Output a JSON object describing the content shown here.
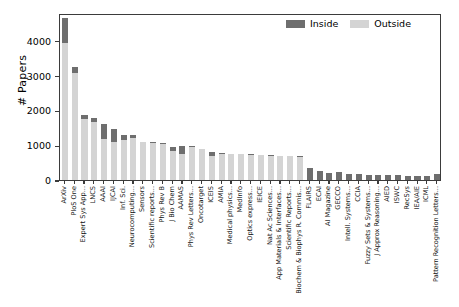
{
  "chart_data": {
    "type": "bar",
    "stacked": true,
    "title": "",
    "xlabel": "",
    "ylabel": "# Papers",
    "ylim": [
      0,
      4800
    ],
    "yticks": [
      0,
      1000,
      2000,
      3000,
      4000
    ],
    "ytick_labels": [
      "0",
      "1000",
      "2000",
      "3000",
      "4000"
    ],
    "grid": false,
    "legend_position": "upper right",
    "colors": {
      "inside": "#6e6e6e",
      "outside": "#d4d4d4",
      "axis": "#3b3b3b"
    },
    "series": [
      {
        "name": "Inside",
        "values": [
          720,
          180,
          130,
          110,
          450,
          400,
          160,
          100,
          20,
          15,
          15,
          140,
          240,
          20,
          15,
          130,
          10,
          10,
          10,
          10,
          10,
          10,
          10,
          10,
          10,
          340,
          270,
          215,
          220,
          180,
          170,
          150,
          140,
          135,
          130,
          125,
          120,
          120,
          170
        ]
      },
      {
        "name": "Outside",
        "values": [
          3930,
          3075,
          1740,
          1680,
          1165,
          1080,
          1140,
          1200,
          1080,
          1070,
          1040,
          820,
          750,
          950,
          890,
          680,
          760,
          745,
          735,
          725,
          710,
          700,
          690,
          680,
          670,
          0,
          0,
          0,
          0,
          0,
          0,
          0,
          0,
          0,
          0,
          0,
          0,
          0,
          0
        ]
      }
    ],
    "totals": [
      4650,
      3255,
      1870,
      1790,
      1615,
      1480,
      1300,
      1300,
      1100,
      1085,
      1055,
      960,
      990,
      970,
      905,
      810,
      770,
      755,
      745,
      735,
      720,
      710,
      700,
      690,
      680,
      340,
      270,
      215,
      220,
      180,
      170,
      150,
      140,
      135,
      130,
      125,
      120,
      120,
      170
    ],
    "categories": [
      "ArXiv",
      "PloS One",
      "Expert Sys App...",
      "LNCS",
      "AAAI",
      "IJCAI",
      "Inf. Sci.",
      "Neurocomputing...",
      "Sensors",
      "Scientific reports...",
      "Phys Rev B",
      "J Bio Chem",
      "AAMAS",
      "Phys Rev Letters...",
      "Oncotarget",
      "ICEIS",
      "AMIA",
      "Medical physics...",
      "MedInfo",
      "Optics express...",
      "IEICE",
      "Nat Ac Sciences...",
      "App Materials & Interfaces...",
      "Scientific Reports...",
      "Biochem & Biophys R. Commis...",
      "FLAIRS",
      "ECAI",
      "AI Magazine",
      "GECCO",
      "Intell. Systems...",
      "CCIA",
      "Fuzzy Sets & Systems...",
      "J Approx Reasoning...",
      "AIED",
      "ISWC",
      "RecSys",
      "IEA/AIE",
      "ICML",
      "Pattern Recognition Letters..."
    ],
    "legend": [
      {
        "label": "Inside",
        "color": "#6e6e6e"
      },
      {
        "label": "Outside",
        "color": "#d4d4d4"
      }
    ]
  }
}
